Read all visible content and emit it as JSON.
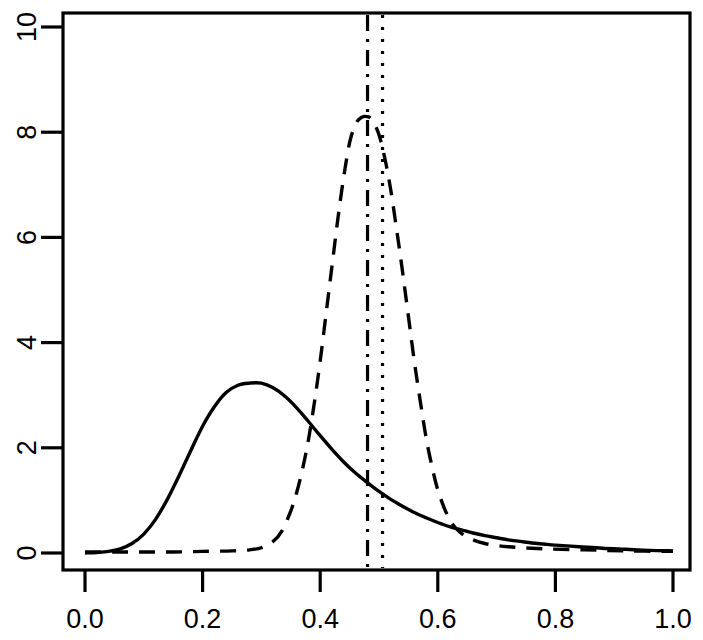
{
  "chart_data": {
    "type": "line",
    "title": "",
    "xlabel": "",
    "ylabel": "",
    "xlim": [
      0.0,
      1.0
    ],
    "ylim": [
      -0.32,
      10.32
    ],
    "grid": false,
    "legend": "none",
    "xticks": [
      0.0,
      0.2,
      0.4,
      0.6,
      0.8,
      1.0
    ],
    "xtick_labels": [
      "0.0",
      "0.2",
      "0.4",
      "0.6",
      "0.8",
      "1.0"
    ],
    "yticks": [
      0,
      2,
      4,
      6,
      8,
      10
    ],
    "ytick_labels": [
      "0",
      "2",
      "4",
      "6",
      "8",
      "10"
    ],
    "series": [
      {
        "name": "solid-density",
        "style": "solid",
        "color": "#000000",
        "peak_x": 0.302,
        "peak_y": 3.23,
        "x": [
          0.0,
          0.02,
          0.04,
          0.06,
          0.08,
          0.1,
          0.12,
          0.14,
          0.16,
          0.18,
          0.2,
          0.22,
          0.24,
          0.26,
          0.28,
          0.3,
          0.32,
          0.34,
          0.36,
          0.38,
          0.4,
          0.42,
          0.44,
          0.46,
          0.48,
          0.5,
          0.52,
          0.54,
          0.56,
          0.58,
          0.6,
          0.62,
          0.64,
          0.66,
          0.68,
          0.7,
          0.72,
          0.74,
          0.76,
          0.78,
          0.8,
          0.84,
          0.88,
          0.92,
          0.96,
          1.0
        ],
        "y": [
          0.0,
          0.01,
          0.03,
          0.08,
          0.18,
          0.36,
          0.64,
          1.02,
          1.47,
          1.95,
          2.41,
          2.78,
          3.05,
          3.19,
          3.23,
          3.23,
          3.14,
          2.98,
          2.76,
          2.5,
          2.23,
          1.97,
          1.73,
          1.52,
          1.34,
          1.17,
          1.02,
          0.89,
          0.77,
          0.67,
          0.58,
          0.5,
          0.44,
          0.38,
          0.33,
          0.29,
          0.25,
          0.22,
          0.19,
          0.17,
          0.15,
          0.12,
          0.09,
          0.07,
          0.05,
          0.04
        ]
      },
      {
        "name": "dashed-density",
        "style": "dashed",
        "color": "#000000",
        "peak_x": 0.482,
        "peak_y": 8.29,
        "x": [
          0.0,
          0.05,
          0.1,
          0.15,
          0.2,
          0.25,
          0.28,
          0.3,
          0.32,
          0.335,
          0.35,
          0.36,
          0.37,
          0.38,
          0.39,
          0.4,
          0.41,
          0.42,
          0.43,
          0.44,
          0.45,
          0.46,
          0.47,
          0.482,
          0.49,
          0.5,
          0.51,
          0.52,
          0.53,
          0.54,
          0.55,
          0.56,
          0.57,
          0.58,
          0.59,
          0.6,
          0.615,
          0.63,
          0.65,
          0.68,
          0.72,
          0.78,
          0.85,
          0.92,
          1.0
        ],
        "y": [
          0.02,
          0.02,
          0.02,
          0.02,
          0.03,
          0.04,
          0.06,
          0.1,
          0.22,
          0.42,
          0.8,
          1.15,
          1.6,
          2.15,
          2.85,
          3.65,
          4.55,
          5.45,
          6.35,
          7.15,
          7.8,
          8.15,
          8.28,
          8.29,
          8.2,
          7.95,
          7.5,
          6.9,
          6.15,
          5.35,
          4.5,
          3.65,
          2.9,
          2.2,
          1.65,
          1.2,
          0.75,
          0.48,
          0.3,
          0.18,
          0.12,
          0.08,
          0.06,
          0.04,
          0.03
        ]
      }
    ],
    "vlines": [
      {
        "name": "dashdot-vline",
        "x": 0.4805,
        "style": "dashdot",
        "color": "#000000"
      },
      {
        "name": "dotted-vline",
        "x": 0.506,
        "style": "dotted",
        "color": "#000000"
      }
    ]
  }
}
